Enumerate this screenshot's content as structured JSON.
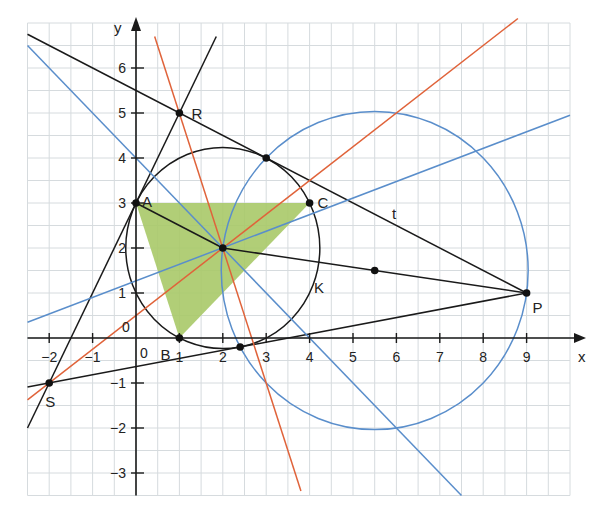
{
  "figure": {
    "axes": {
      "x_label": "x",
      "y_label": "y",
      "x_range": [
        -2.5,
        10
      ],
      "y_range": [
        -3.5,
        7
      ],
      "grid_step": 0.5,
      "x_ticks": [
        -2,
        -1,
        1,
        2,
        3,
        4,
        5,
        6,
        7,
        8,
        9
      ],
      "x_tick_labels": [
        "−2",
        "−1",
        "1",
        "2",
        "3",
        "4",
        "5",
        "6",
        "7",
        "8",
        "9"
      ],
      "y_ticks": [
        -3,
        -2,
        -1,
        1,
        2,
        3,
        4,
        5,
        6
      ],
      "y_tick_labels": [
        "−3",
        "−2",
        "−1",
        "1",
        "2",
        "3",
        "4",
        "5",
        "6"
      ],
      "origin_labels": [
        "0",
        "0"
      ]
    },
    "colors": {
      "grid": "#d6dbde",
      "axis": "#1a1a1a",
      "black_line": "#1a1a1a",
      "red_line": "#e0633a",
      "blue_line": "#5a8ecb",
      "triangle_fill": "#a8c968",
      "point": "#111111"
    },
    "triangle": {
      "vertices": [
        [
          0,
          3
        ],
        [
          1,
          0
        ],
        [
          4,
          3
        ]
      ],
      "labels": [
        "A",
        "B",
        "C"
      ]
    },
    "points": [
      {
        "name": "A",
        "x": 0,
        "y": 3,
        "label": "A",
        "dx": 6,
        "dy": 4
      },
      {
        "name": "B",
        "x": 1,
        "y": 0,
        "label": "B",
        "dx": -19,
        "dy": 22
      },
      {
        "name": "C",
        "x": 4,
        "y": 3,
        "label": "C",
        "dx": 8,
        "dy": 5
      },
      {
        "name": "R",
        "x": 1,
        "y": 5,
        "label": "R",
        "dx": 12,
        "dy": 6
      },
      {
        "name": "S",
        "x": -2,
        "y": -1,
        "label": "S",
        "dx": -4,
        "dy": 24
      },
      {
        "name": "P",
        "x": 9,
        "y": 1,
        "label": "P",
        "dx": 6,
        "dy": 20
      },
      {
        "name": "M",
        "x": 2,
        "y": 2,
        "label": ""
      },
      {
        "name": "T1",
        "x": 3,
        "y": 4,
        "label": ""
      },
      {
        "name": "T2",
        "x": 2.4,
        "y": -0.2,
        "label": ""
      },
      {
        "name": "H",
        "x": 5.5,
        "y": 1.5,
        "label": ""
      }
    ],
    "circles": [
      {
        "name": "K",
        "cx": 2,
        "cy": 2,
        "r": 2.236,
        "color": "black",
        "label": "K",
        "label_x": 4.1,
        "label_y": 1.0
      },
      {
        "name": "thales-circle",
        "cx": 5.5,
        "cy": 1.5,
        "r": 3.536,
        "color": "blue",
        "label": ""
      }
    ],
    "lines": [
      {
        "name": "tangent-t",
        "color": "black",
        "x1": -2.5,
        "y1": 6.75,
        "x2": 9,
        "y2": 1,
        "label": "t",
        "label_x": 5.9,
        "label_y": 2.65
      },
      {
        "name": "tangent-SP",
        "color": "black",
        "x1": -2.5,
        "y1": -1.0909,
        "x2": 9,
        "y2": 1
      },
      {
        "name": "tangent-SR",
        "color": "black",
        "x1": -2.5,
        "y1": -2,
        "x2": 1.85,
        "y2": 6.7
      },
      {
        "name": "segment-AM-P",
        "color": "black",
        "x1": 0,
        "y1": 3,
        "x2": 2,
        "y2": 2
      },
      {
        "name": "segment-MP",
        "color": "black",
        "x1": 2,
        "y1": 2,
        "x2": 9,
        "y2": 1
      },
      {
        "name": "bisector-R",
        "color": "red",
        "x1": 0.43,
        "y1": 6.7,
        "x2": 3.8,
        "y2": -3.4
      },
      {
        "name": "bisector-S",
        "color": "red",
        "x1": -2.5,
        "y1": -1.375,
        "x2": 8.8,
        "y2": 7.1
      },
      {
        "name": "blue-line-1",
        "color": "blue",
        "x1": -2.5,
        "y1": 6.5,
        "x2": 7.5,
        "y2": -3.5
      },
      {
        "name": "blue-line-2",
        "color": "blue",
        "x1": -2.5,
        "y1": 0.35,
        "x2": 10,
        "y2": 4.95
      }
    ]
  }
}
